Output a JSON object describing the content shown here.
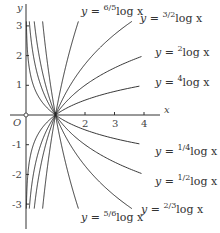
{
  "chart_data": {
    "type": "line",
    "title": "",
    "xlabel": "x",
    "ylabel": "y",
    "origin_label": "O",
    "xlim": [
      0,
      4.5
    ],
    "ylim": [
      -3.3,
      3.4
    ],
    "x_ticks": [
      "1",
      "2",
      "3",
      "4"
    ],
    "y_ticks": [
      "3",
      "2",
      "1",
      "-1",
      "-2",
      "-3"
    ],
    "series": [
      {
        "name": "y = log_{6/5} x",
        "base": 1.2,
        "label_prefix": "y = ",
        "label_base": "6/5",
        "label_suffix": "log x"
      },
      {
        "name": "y = log_{3/2} x",
        "base": 1.5,
        "label_prefix": "y = ",
        "label_base": "3/2",
        "label_suffix": "log x"
      },
      {
        "name": "y = log_{2} x",
        "base": 2,
        "label_prefix": "y = ",
        "label_base": "2",
        "label_suffix": "log x"
      },
      {
        "name": "y = log_{4} x",
        "base": 4,
        "label_prefix": "y = ",
        "label_base": "4",
        "label_suffix": "log x"
      },
      {
        "name": "y = log_{1/4} x",
        "base": 0.25,
        "label_prefix": "y = ",
        "label_base": "1/4",
        "label_suffix": "log x"
      },
      {
        "name": "y = log_{1/2} x",
        "base": 0.5,
        "label_prefix": "y = ",
        "label_base": "1/2",
        "label_suffix": "log x"
      },
      {
        "name": "y = log_{2/3} x",
        "base": 0.6667,
        "label_prefix": "y = ",
        "label_base": "2/3",
        "label_suffix": "log x"
      },
      {
        "name": "y = log_{5/6} x",
        "base": 0.8333,
        "label_prefix": "y = ",
        "label_base": "5/6",
        "label_suffix": "log x"
      }
    ],
    "common_point": [
      1,
      0
    ],
    "grid": false,
    "legend": "inline labels"
  }
}
